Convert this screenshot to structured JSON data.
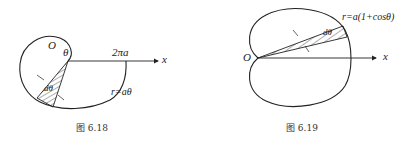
{
  "figures": [
    {
      "id": "fig-6-18",
      "caption": "图 6.18",
      "labels": {
        "origin": "O",
        "angle": "θ",
        "endpoint": "2πa",
        "axis": "x",
        "dtheta": "dθ",
        "equation": "r=aθ"
      },
      "curve": "Archimedean spiral"
    },
    {
      "id": "fig-6-19",
      "caption": "图 6.19",
      "labels": {
        "origin": "O",
        "axis": "x",
        "dtheta": "dθ",
        "equation": "r=a(1+cosθ)"
      },
      "curve": "cardioid"
    }
  ]
}
